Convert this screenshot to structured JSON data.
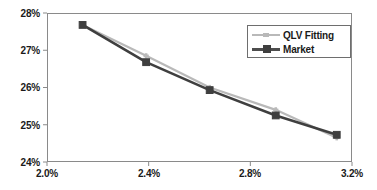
{
  "chart_data": {
    "type": "line",
    "title": "",
    "xlabel": "",
    "ylabel": "",
    "xlim": [
      2.0,
      3.2
    ],
    "ylim": [
      24,
      28
    ],
    "grid": false,
    "legend_position": "top-right",
    "x_tick_labels": [
      "2.0%",
      "2.4%",
      "2.8%",
      "3.2%"
    ],
    "x_ticks": [
      2.0,
      2.4,
      2.8,
      3.2
    ],
    "y_tick_labels": [
      "24%",
      "25%",
      "26%",
      "27%",
      "28%"
    ],
    "y_ticks": [
      24,
      25,
      26,
      27,
      28
    ],
    "x": [
      2.14,
      2.39,
      2.64,
      2.9,
      3.14
    ],
    "series": [
      {
        "name": "QLV Fitting",
        "color": "#b9b9b9",
        "marker": "plus",
        "values": [
          27.68,
          26.85,
          26.0,
          25.4,
          24.65
        ]
      },
      {
        "name": "Market",
        "color": "#3f3f3f",
        "marker": "square",
        "values": [
          27.68,
          26.68,
          25.93,
          25.25,
          24.73
        ]
      }
    ]
  },
  "axis": {
    "y_labels": [
      "28%",
      "27%",
      "26%",
      "25%",
      "24%"
    ],
    "x_labels": [
      "2.0%",
      "2.4%",
      "2.8%",
      "3.2%"
    ]
  },
  "legend": {
    "entries": [
      {
        "label": "QLV Fitting"
      },
      {
        "label": "Market"
      }
    ]
  },
  "colors": {
    "market_line": "#3f3f3f",
    "qlv_line": "#b9b9b9",
    "frame": "#8a8a8a",
    "text": "#1a1a1a",
    "background": "#ffffff"
  }
}
